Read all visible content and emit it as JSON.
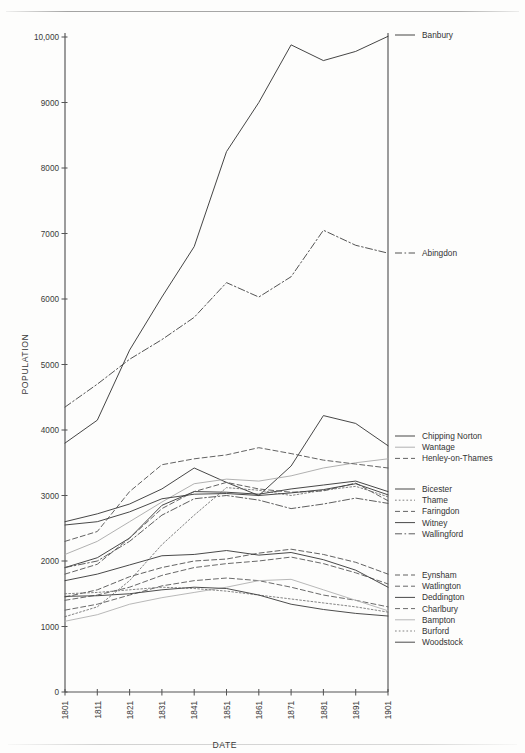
{
  "chart_data": {
    "type": "line",
    "title": "",
    "xlabel": "DATE",
    "ylabel": "POPULATION",
    "x": [
      1801,
      1811,
      1821,
      1831,
      1841,
      1851,
      1861,
      1871,
      1881,
      1891,
      1901
    ],
    "xtick_labels": [
      "1801",
      "1811",
      "1821",
      "1831",
      "1841",
      "1851",
      "1861",
      "1871",
      "1881",
      "1891",
      "1901"
    ],
    "ytick_labels": [
      "0",
      "1000",
      "2000",
      "3000",
      "4000",
      "5000",
      "6000",
      "7000",
      "8000",
      "9000",
      "10,000"
    ],
    "yticks": [
      0,
      1000,
      2000,
      3000,
      4000,
      5000,
      6000,
      7000,
      8000,
      9000,
      10000
    ],
    "ylim": [
      0,
      10000
    ],
    "xlim": [
      1801,
      1901
    ],
    "grid": false,
    "legend_position": "right",
    "series": [
      {
        "name": "Banbury",
        "style": "solid",
        "color": "#3b3b3b",
        "values": [
          3800,
          4150,
          5220,
          6030,
          6800,
          8250,
          9000,
          9880,
          9640,
          9780,
          10010
        ]
      },
      {
        "name": "Abingdon",
        "style": "dashdot",
        "color": "#4a4a4a",
        "values": [
          4350,
          4700,
          5080,
          5380,
          5720,
          6250,
          6030,
          6340,
          7050,
          6820,
          6700
        ]
      },
      {
        "name": "Chipping Norton",
        "style": "solid",
        "color": "#3d3d3d",
        "values": [
          2600,
          2720,
          2870,
          3100,
          3420,
          3200,
          3000,
          3450,
          4220,
          4100,
          3760
        ]
      },
      {
        "name": "Wantage",
        "style": "light",
        "color": "#a8a8a8",
        "values": [
          2100,
          2300,
          2600,
          2900,
          3180,
          3250,
          3220,
          3300,
          3420,
          3500,
          3560
        ]
      },
      {
        "name": "Henley-on-Thames",
        "style": "dashed",
        "color": "#5a5a5a",
        "values": [
          2300,
          2450,
          3060,
          3470,
          3560,
          3620,
          3730,
          3640,
          3540,
          3480,
          3420
        ]
      },
      {
        "name": "Bicester",
        "style": "solid",
        "color": "#3d3d3d",
        "values": [
          1900,
          2050,
          2350,
          2850,
          3060,
          3050,
          3020,
          3100,
          3160,
          3220,
          3060
        ]
      },
      {
        "name": "Thame",
        "style": "dotted",
        "color": "#6a6a6a",
        "values": [
          1150,
          1300,
          1700,
          2250,
          2700,
          3120,
          3080,
          3000,
          3080,
          3140,
          2980
        ]
      },
      {
        "name": "Faringdon",
        "style": "dashed",
        "color": "#5c5c5c",
        "values": [
          1800,
          1950,
          2350,
          2800,
          3060,
          3200,
          3100,
          3050,
          3070,
          3190,
          2920
        ]
      },
      {
        "name": "Witney",
        "style": "solid",
        "color": "#3f3f3f",
        "values": [
          2550,
          2600,
          2750,
          2950,
          3020,
          3030,
          3000,
          3040,
          3090,
          3180,
          3010
        ]
      },
      {
        "name": "Wallingford",
        "style": "dashdot",
        "color": "#555555",
        "values": [
          1900,
          2000,
          2300,
          2700,
          2950,
          3000,
          2930,
          2800,
          2870,
          2960,
          2880
        ]
      },
      {
        "name": "Eynsham",
        "style": "dashed",
        "color": "#585858",
        "values": [
          1450,
          1560,
          1760,
          1900,
          2000,
          2030,
          2120,
          2180,
          2100,
          1980,
          1800
        ]
      },
      {
        "name": "Watlington",
        "style": "dashed",
        "color": "#606060",
        "values": [
          1400,
          1480,
          1600,
          1780,
          1900,
          1960,
          2000,
          2060,
          1960,
          1820,
          1650
        ]
      },
      {
        "name": "Deddington",
        "style": "solid",
        "color": "#3f3f3f",
        "values": [
          1700,
          1800,
          1940,
          2080,
          2100,
          2160,
          2090,
          2130,
          2020,
          1860,
          1600
        ]
      },
      {
        "name": "Charlbury",
        "style": "dashed",
        "color": "#626262",
        "values": [
          1250,
          1340,
          1480,
          1620,
          1700,
          1740,
          1700,
          1600,
          1480,
          1400,
          1300
        ]
      },
      {
        "name": "Bampton",
        "style": "light",
        "color": "#b0b0b0",
        "values": [
          1080,
          1180,
          1340,
          1440,
          1520,
          1600,
          1700,
          1720,
          1560,
          1400,
          1240
        ]
      },
      {
        "name": "Burford",
        "style": "dotted",
        "color": "#6e6e6e",
        "values": [
          1500,
          1520,
          1560,
          1600,
          1580,
          1540,
          1480,
          1420,
          1360,
          1300,
          1220
        ]
      },
      {
        "name": "Woodstock",
        "style": "solid",
        "color": "#424242",
        "values": [
          1460,
          1470,
          1500,
          1560,
          1600,
          1580,
          1480,
          1340,
          1260,
          1200,
          1160
        ]
      }
    ],
    "legend_groups": [
      {
        "y": 35,
        "items": [
          "Banbury"
        ]
      },
      {
        "y": 253,
        "items": [
          "Abingdon"
        ]
      },
      {
        "y": 436,
        "items": [
          "Chipping Norton",
          "Wantage",
          "Henley-on-Thames"
        ]
      },
      {
        "y": 489,
        "items": [
          "Bicester",
          "Thame",
          "Faringdon",
          "Witney",
          "Wallingford"
        ]
      },
      {
        "y": 575,
        "items": [
          "Eynsham",
          "Watlington",
          "Deddington",
          "Charlbury",
          "Bampton",
          "Burford",
          "Woodstock"
        ]
      }
    ]
  }
}
